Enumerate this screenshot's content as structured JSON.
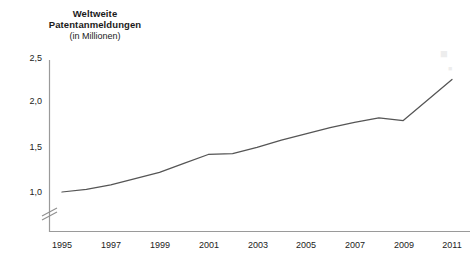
{
  "chart_data": {
    "type": "line",
    "title": "Weltweite\nPatentanmeldungen",
    "subtitle": "(in Millionen)",
    "xlabel": "",
    "ylabel": "",
    "x": [
      1995,
      1996,
      1997,
      1998,
      1999,
      2000,
      2001,
      2002,
      2003,
      2004,
      2005,
      2006,
      2007,
      2008,
      2009,
      2010,
      2011
    ],
    "values": [
      1.0,
      1.03,
      1.08,
      1.15,
      1.22,
      1.32,
      1.42,
      1.43,
      1.5,
      1.58,
      1.65,
      1.72,
      1.78,
      1.83,
      1.8,
      2.03,
      2.26
    ],
    "series": [
      {
        "name": "Weltweite Patentanmeldungen",
        "values": [
          1.0,
          1.03,
          1.08,
          1.15,
          1.22,
          1.32,
          1.42,
          1.43,
          1.5,
          1.58,
          1.65,
          1.72,
          1.78,
          1.83,
          1.8,
          2.03,
          2.26
        ],
        "color": "#555555"
      }
    ],
    "xticks": [
      1995,
      1997,
      1999,
      2001,
      2003,
      2005,
      2007,
      2009,
      2011
    ],
    "xtick_labels": [
      "1995",
      "1997",
      "1999",
      "2001",
      "2003",
      "2005",
      "2007",
      "2009",
      "2011"
    ],
    "yticks": [
      1.0,
      1.5,
      2.0,
      2.5
    ],
    "ytick_labels": [
      "1,0",
      "1,5",
      "2,0",
      "2,5"
    ],
    "xlim": [
      1995,
      2011
    ],
    "ylim": [
      0.9,
      2.55
    ],
    "grid": false,
    "legend": false,
    "axis_break": {
      "axis": "y",
      "symbol": "//",
      "note": "y-axis broken below 1,0"
    },
    "line_color": "#555555",
    "axis_color": "#999999"
  },
  "watermark": {
    "name": "faint-logo-watermark",
    "visible": true
  }
}
